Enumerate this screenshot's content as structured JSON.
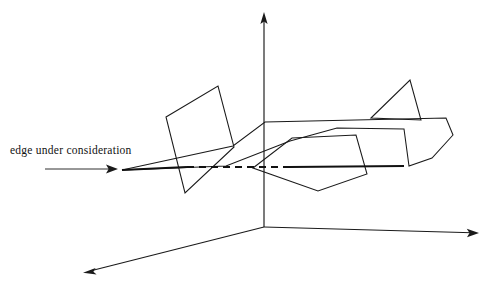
{
  "figure": {
    "background_color": "#ffffff",
    "stroke_color": "#1a1a1a",
    "type": "3d-line-drawing"
  },
  "annotations": {
    "edge_label": "edge under consideration"
  },
  "chart_data": {
    "type": "diagram",
    "title": "edge under consideration",
    "axes": {
      "origin": [
        264,
        227
      ],
      "vertical_axis": {
        "from": [
          264,
          227
        ],
        "to": [
          264,
          14
        ],
        "arrow": true
      },
      "left_ground_axis": {
        "from": [
          264,
          227
        ],
        "to": [
          85,
          272
        ],
        "arrow": true
      },
      "right_ground_axis": {
        "from": [
          264,
          227
        ],
        "to": [
          478,
          233
        ],
        "arrow": true
      }
    },
    "edge_under_consideration": {
      "visible_segments": [
        {
          "from": [
            122,
            170
          ],
          "to": [
            187,
            167
          ]
        },
        {
          "from": [
            290,
            167
          ],
          "to": [
            404,
            166
          ]
        }
      ],
      "hidden_segments": [
        {
          "from": [
            187,
            167
          ],
          "to": [
            290,
            167
          ]
        }
      ],
      "stroke_width_visible": 2.2,
      "stroke_width_hidden": 1.8,
      "dash_pattern": "7 5"
    },
    "callout_arrow": {
      "from": [
        45,
        169
      ],
      "to": [
        118,
        169
      ]
    },
    "faces": [
      {
        "name": "left-quadrilateral",
        "points": [
          [
            166,
            117
          ],
          [
            218,
            86
          ],
          [
            234,
            147
          ],
          [
            185,
            193
          ]
        ]
      },
      {
        "name": "pentagon",
        "points": [
          [
            253,
            168
          ],
          [
            292,
            138
          ],
          [
            356,
            135
          ],
          [
            367,
            174
          ],
          [
            318,
            191
          ]
        ]
      },
      {
        "name": "wing-polygon",
        "points": [
          [
            122,
            170
          ],
          [
            233,
            146
          ],
          [
            265,
            122
          ],
          [
            446,
            118
          ],
          [
            453,
            135
          ],
          [
            432,
            158
          ],
          [
            409,
            166
          ],
          [
            404,
            129
          ],
          [
            337,
            128
          ],
          [
            290,
            141
          ],
          [
            226,
            166
          ]
        ]
      },
      {
        "name": "fin-triangle",
        "points": [
          [
            371,
            118
          ],
          [
            410,
            80
          ],
          [
            421,
            120
          ]
        ]
      }
    ],
    "helper_lines": [
      {
        "from": [
          264,
          14
        ],
        "to": [
          264,
          227
        ]
      },
      {
        "from": [
          264,
          227
        ],
        "to": [
          264,
          191
        ]
      }
    ]
  }
}
